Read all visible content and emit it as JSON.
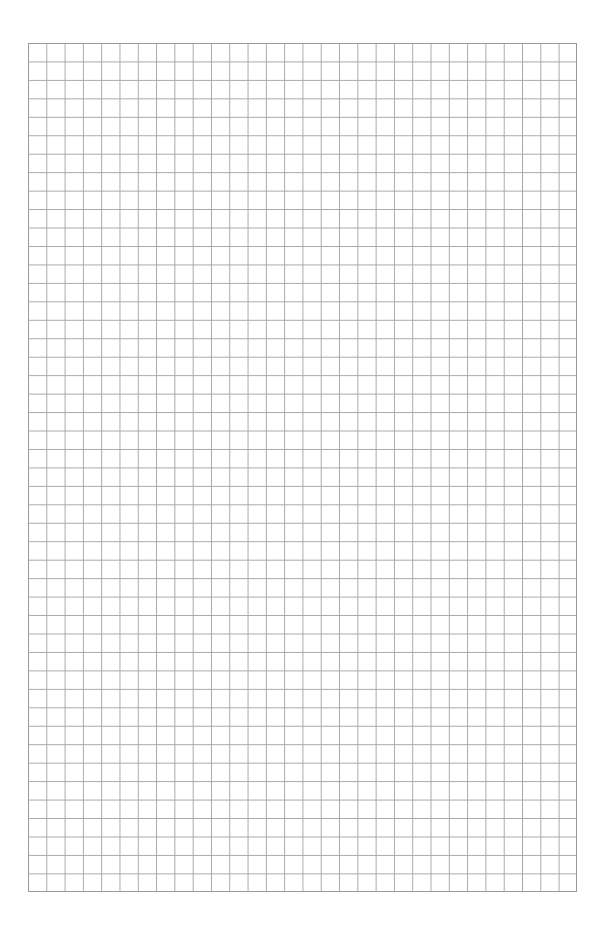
{
  "page": {
    "type": "graph-paper",
    "grid": {
      "columns": 30,
      "rows": 46,
      "line_color": "#a8a8a8",
      "border_color": "#9a9a9a",
      "background": "#ffffff"
    }
  }
}
